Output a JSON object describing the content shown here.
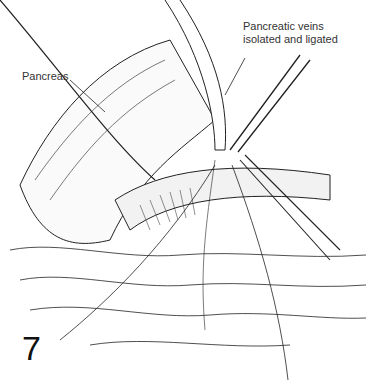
{
  "figure": {
    "number": "7",
    "labels": {
      "pancreas": "Pancreas",
      "veins_line1": "Pancreatic veins",
      "veins_line2": "isolated and ligated"
    }
  }
}
